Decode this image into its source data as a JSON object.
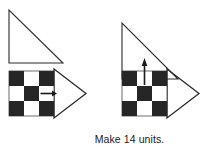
{
  "page": {
    "background_color": "#ffffff",
    "caption": "Make 14 units.",
    "width": 210,
    "height": 151
  },
  "colors": {
    "dark_square": "#262626",
    "light_square": "#ffffff",
    "outline": "#2b2b2b",
    "arrow": "#1a1a1a",
    "text": "#1a1a1a"
  },
  "figures": {
    "left": {
      "name": "pieces-diagram",
      "triangle": {
        "label": "right-triangle-piece",
        "right_angle_corner": "bottom-left",
        "x": 9,
        "y": 10,
        "size": 54,
        "fill": "none",
        "stroke": "#2b2b2b"
      },
      "unit": {
        "label": "checkerboard-unit",
        "grid_rows": 3,
        "grid_cols": 3,
        "x": 9,
        "y": 71,
        "cell_size": 15,
        "pattern": [
          [
            "dark",
            "light",
            "dark"
          ],
          [
            "light",
            "dark",
            "light"
          ],
          [
            "dark",
            "light",
            "dark"
          ]
        ],
        "arrow": {
          "label": "right-arrow-marker",
          "direction": "right",
          "cell_row": 2,
          "cell_col": 3
        },
        "triangle_overlay": {
          "label": "right-pointing-triangle-outline",
          "direction": "right",
          "apex_x": 86,
          "top_y": 69,
          "bottom_y": 118,
          "base_x": 54
        }
      }
    },
    "right": {
      "name": "assembly-diagram",
      "triangle": {
        "label": "right-triangle-piece",
        "right_angle_corner": "bottom-left",
        "x": 122,
        "y": 23,
        "size": 56,
        "fill": "none",
        "stroke": "#2b2b2b"
      },
      "unit": {
        "label": "checkerboard-unit",
        "grid_rows": 3,
        "grid_cols": 3,
        "x": 122,
        "y": 71,
        "cell_size": 15,
        "pattern": [
          [
            "dark",
            "light",
            "dark"
          ],
          [
            "light",
            "dark",
            "light"
          ],
          [
            "dark",
            "light",
            "dark"
          ]
        ],
        "arrow": {
          "label": "up-arrow-marker",
          "direction": "up",
          "cell_row": 1,
          "cell_col": 2
        },
        "triangle_overlay": {
          "label": "right-pointing-triangle-outline",
          "direction": "right",
          "apex_x": 199,
          "top_y": 69,
          "bottom_y": 118,
          "base_x": 167
        }
      }
    }
  }
}
